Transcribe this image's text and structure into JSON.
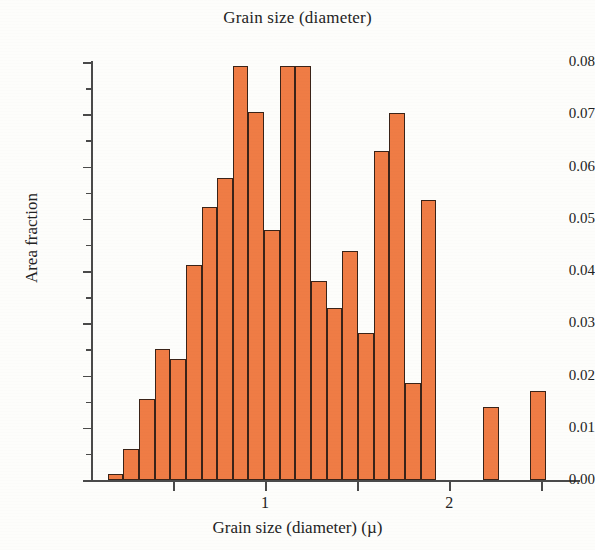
{
  "chart_data": {
    "type": "bar",
    "title": "Grain size (diameter)",
    "xlabel": "Grain size (diameter) (µ)",
    "ylabel": "Area fraction",
    "xlim": [
      0.06,
      2.7
    ],
    "ylim": [
      0.0,
      0.08
    ],
    "grid": false,
    "legend": null,
    "bar_color": "#ef7c45",
    "bar_edge_color": "#3a2318",
    "x_major_ticks": [
      0.5,
      1.0,
      1.5,
      2.0,
      2.5
    ],
    "x_tick_labels": [
      "",
      "1",
      "",
      "2",
      ""
    ],
    "y_major_ticks": [
      0.0,
      0.01,
      0.02,
      0.03,
      0.04,
      0.05,
      0.06,
      0.07,
      0.08
    ],
    "y_tick_labels": [
      "0.00",
      "0.01",
      "0.02",
      "0.03",
      "0.04",
      "0.05",
      "0.06",
      "0.07",
      "0.08"
    ],
    "y_minor_ticks": [
      0.005,
      0.015,
      0.025,
      0.035,
      0.045,
      0.055,
      0.065,
      0.075
    ],
    "bin_width": 0.085,
    "bins": [
      {
        "x0": 0.145,
        "x1": 0.23,
        "value": 0.0012
      },
      {
        "x0": 0.23,
        "x1": 0.315,
        "value": 0.006
      },
      {
        "x0": 0.315,
        "x1": 0.4,
        "value": 0.0155
      },
      {
        "x0": 0.4,
        "x1": 0.485,
        "value": 0.025
      },
      {
        "x0": 0.485,
        "x1": 0.57,
        "value": 0.0232
      },
      {
        "x0": 0.57,
        "x1": 0.655,
        "value": 0.0412
      },
      {
        "x0": 0.655,
        "x1": 0.74,
        "value": 0.0522
      },
      {
        "x0": 0.74,
        "x1": 0.825,
        "value": 0.0578
      },
      {
        "x0": 0.825,
        "x1": 0.91,
        "value": 0.0793
      },
      {
        "x0": 0.91,
        "x1": 0.995,
        "value": 0.0705
      },
      {
        "x0": 0.995,
        "x1": 1.08,
        "value": 0.0479
      },
      {
        "x0": 1.08,
        "x1": 1.165,
        "value": 0.0792
      },
      {
        "x0": 1.165,
        "x1": 1.25,
        "value": 0.0792
      },
      {
        "x0": 1.25,
        "x1": 1.335,
        "value": 0.0381
      },
      {
        "x0": 1.335,
        "x1": 1.42,
        "value": 0.0329
      },
      {
        "x0": 1.42,
        "x1": 1.505,
        "value": 0.0438
      },
      {
        "x0": 1.505,
        "x1": 1.59,
        "value": 0.0281
      },
      {
        "x0": 1.59,
        "x1": 1.675,
        "value": 0.063
      },
      {
        "x0": 1.675,
        "x1": 1.76,
        "value": 0.0703
      },
      {
        "x0": 1.76,
        "x1": 1.845,
        "value": 0.0186
      },
      {
        "x0": 1.845,
        "x1": 1.93,
        "value": 0.0536
      },
      {
        "x0": 2.185,
        "x1": 2.27,
        "value": 0.014
      },
      {
        "x0": 2.44,
        "x1": 2.525,
        "value": 0.017
      }
    ]
  }
}
